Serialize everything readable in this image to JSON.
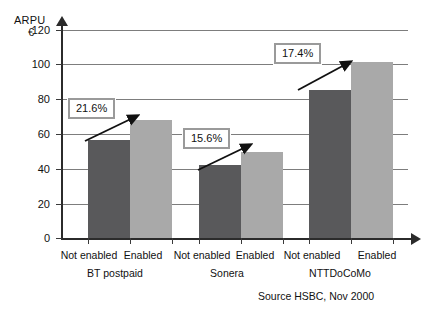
{
  "chart_data": {
    "type": "bar",
    "title": "",
    "ylabel": "ARPU",
    "yunit": "€",
    "xlabel": "",
    "ylim": [
      0,
      130
    ],
    "grid": true,
    "legend": "none",
    "ytick_labels": [
      "0",
      "20",
      "40",
      "60",
      "80",
      "100",
      "120"
    ],
    "ytick_values": [
      0,
      20,
      40,
      60,
      80,
      100,
      120
    ],
    "categories": [
      "Not enabled",
      "Enabled",
      "Not enabled",
      "Enabled",
      "Not enabled",
      "Enabled"
    ],
    "groups": [
      "BT postpaid",
      "Sonera",
      "NTTDoCoMo"
    ],
    "series": [
      {
        "name": "ARPU",
        "values": [
          60,
          72,
          45,
          53,
          90,
          107
        ],
        "colors": [
          "#59595b",
          "#a9a9a9",
          "#59595b",
          "#a9a9a9",
          "#59595b",
          "#a9a9a9"
        ]
      }
    ],
    "annotations": [
      {
        "label": "21.6%",
        "group": "BT postpaid"
      },
      {
        "label": "15.6%",
        "group": "Sonera"
      },
      {
        "label": "17.4%",
        "group": "NTTDoCoMo"
      }
    ],
    "source": "Source HSBC, Nov 2000"
  },
  "colors": {
    "bar_dark": "#59595b",
    "bar_light": "#a9a9a9",
    "gridline": "#7d7d7d",
    "axis": "#2b2b2b",
    "callout_border": "#9a9a9a",
    "background": "#ffffff"
  }
}
